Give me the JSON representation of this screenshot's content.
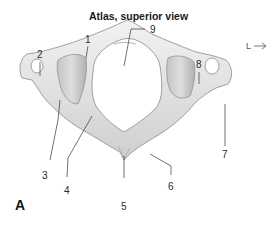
{
  "figure": {
    "title": "Atlas, superior view",
    "panel_label": "A",
    "orientation_marker": "L",
    "labels": [
      {
        "id": "1",
        "text": "1"
      },
      {
        "id": "2",
        "text": "2"
      },
      {
        "id": "3",
        "text": "3"
      },
      {
        "id": "4",
        "text": "4"
      },
      {
        "id": "5",
        "text": "5"
      },
      {
        "id": "6",
        "text": "6"
      },
      {
        "id": "7",
        "text": "7"
      },
      {
        "id": "8",
        "text": "8"
      },
      {
        "id": "9",
        "text": "9"
      }
    ],
    "colors": {
      "bone_light": "#ececec",
      "bone_mid": "#d2d2d2",
      "bone_shadow": "#a9a9a9",
      "outline": "#8a8a8a",
      "leader": "#333333"
    }
  }
}
